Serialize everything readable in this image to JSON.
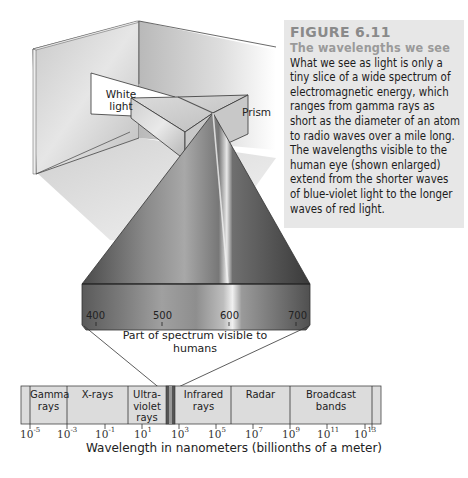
{
  "figure": {
    "number": "FIGURE 6.11",
    "title": "The wavelengths we see",
    "caption": "What we see as light is only a tiny slice of a wide spectrum of electromagnetic energy, which ranges from gamma rays as short as the diameter of an atom to radio waves over a mile long. The wavelengths visible to the human eye (shown enlarged) extend from the shorter waves of blue-violet light to the longer waves of red light."
  },
  "illustration": {
    "white_light_label": "White light",
    "prism_label": "Prism"
  },
  "visible_spectrum": {
    "ticks": [
      "400",
      "500",
      "600",
      "700"
    ],
    "unit_hint": "nanometers",
    "label": "Part of spectrum visible to humans"
  },
  "em_spectrum": {
    "bands": [
      {
        "name": "Gamma rays"
      },
      {
        "name": "X-rays"
      },
      {
        "name": "Ultra-violet rays"
      },
      {
        "name": "Visible"
      },
      {
        "name": "Infrared rays"
      },
      {
        "name": "Radar"
      },
      {
        "name": "Broadcast bands"
      }
    ],
    "tick_exponents": [
      "-5",
      "-3",
      "-1",
      "1",
      "3",
      "5",
      "7",
      "9",
      "11",
      "13"
    ],
    "tick_base": "10",
    "axis_title": "Wavelength in nanometers (billionths of a meter)"
  },
  "colors": {
    "caption_bg": "#e7e7e7",
    "figure_number": "#8a8a8a",
    "band_fill": "#dcdcdc",
    "outline": "#333333"
  }
}
